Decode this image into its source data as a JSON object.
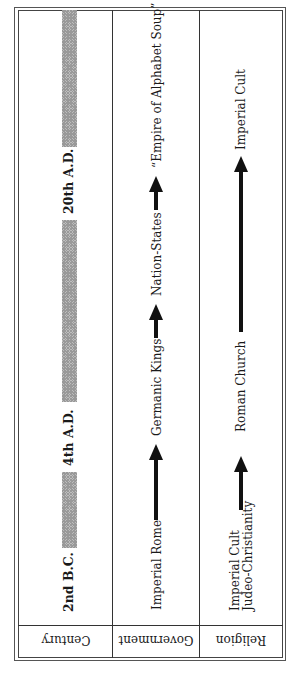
{
  "diagram": {
    "orientation": "rotated 90 degrees counter-clockwise; header labels upside-down",
    "row_labels": {
      "century": "Century",
      "government": "Government",
      "religion": "Religion"
    },
    "century": {
      "markers": [
        {
          "label": "2nd B.C."
        },
        {
          "label": "4th  A.D."
        },
        {
          "label": "20th  A.D."
        }
      ],
      "bars": [
        {
          "from": "2nd B.C.",
          "to": "4th A.D."
        },
        {
          "from": "4th A.D.",
          "to": "20th A.D."
        },
        {
          "from": "20th A.D.",
          "to": "present"
        }
      ]
    },
    "government": {
      "stages": [
        {
          "label": "Imperial Rome"
        },
        {
          "label": "Germanic Kings"
        },
        {
          "label": "Nation-States"
        },
        {
          "label": "“Empire of Alphabet Soup”"
        }
      ]
    },
    "religion": {
      "stages": [
        {
          "label_line1": "Imperial Cult",
          "label_line2": "Judeo-Christianity"
        },
        {
          "label": "Roman Church"
        },
        {
          "label": "Imperial Cult"
        }
      ]
    }
  }
}
